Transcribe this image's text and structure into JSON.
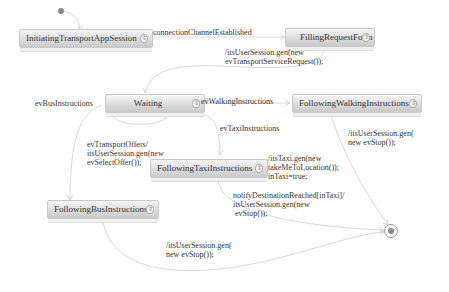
{
  "diagram": {
    "type": "state-machine",
    "states": [
      {
        "id": "initiating",
        "label": "InitiatingTransportAppSession"
      },
      {
        "id": "filling",
        "label": "FillingRequestForm"
      },
      {
        "id": "waiting",
        "label": "Waiting"
      },
      {
        "id": "walking",
        "label": "FollowingWalkingInstructions"
      },
      {
        "id": "taxi",
        "label": "FollowingTaxiInstructions"
      },
      {
        "id": "bus",
        "label": "FollowingBusInstructions"
      }
    ],
    "state_icon": "state-expand-icon",
    "transitions": [
      {
        "id": "t_connection",
        "label": "connectionChannelEstablished"
      },
      {
        "id": "t_filling_waiting",
        "label": "/itsUserSession.gen(new\nevTransportServiceRequest());"
      },
      {
        "id": "t_bus",
        "label": "evBusInstructions"
      },
      {
        "id": "t_walking",
        "label": "evWalkingInstructions"
      },
      {
        "id": "t_taxi",
        "label": "evTaxiInstructions"
      },
      {
        "id": "t_offers",
        "label": "evTransportOffers/\nitsUserSession.gen(new\nevSelectOffer());"
      },
      {
        "id": "t_walking_final",
        "label": "/itsUserSession.gen(\nnew evStop());"
      },
      {
        "id": "t_taxi_entry",
        "label": "/itsTaxi.gen(new\ntakeMeToLocation());\ninTaxi=true;"
      },
      {
        "id": "t_taxi_final",
        "label": "notifyDestinationReached[inTaxi]/\nitsUserSession.gen(new\n evStop());"
      },
      {
        "id": "t_bus_final",
        "label": "/itsUserSession.gen(\nnew evStop());"
      }
    ],
    "colors": {
      "edge": "#d8d8d8",
      "state_border": "#c8c8c8",
      "initial_dot": "#888888",
      "final_ring": "#999999"
    }
  }
}
